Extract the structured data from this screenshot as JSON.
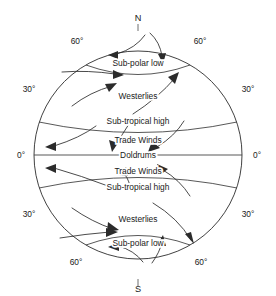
{
  "diagram": {
    "title_present": false,
    "type": "global-atmospheric-circulation",
    "poles": {
      "north": "N",
      "south": "S"
    },
    "latitude_labels": {
      "north_60_left": "60°",
      "north_60_right": "60°",
      "north_30_left": "30°",
      "north_30_right": "30°",
      "equator_left": "0°",
      "equator_right": "0°",
      "south_30_left": "30°",
      "south_30_right": "30°",
      "south_60_left": "60°",
      "south_60_right": "60°"
    },
    "zones": {
      "north_subpolar_low": "Sub-polar low",
      "north_westerlies": "Westerlies",
      "north_subtropical_high": "Sub-tropical high",
      "north_trade_winds": "Trade Winds",
      "doldrums": "Doldrums",
      "south_trade_winds": "Trade Winds",
      "south_subtropical_high": "Sub-tropical high",
      "south_westerlies": "Westerlies",
      "south_subpolar_low": "Sub-polar low"
    },
    "colors": {
      "background": "#ffffff",
      "outline": "#2b2b2b",
      "text": "#1a1a1a",
      "flow": "#2b2b2b"
    },
    "geometry": {
      "center_x": 138,
      "center_y": 155,
      "radius": 104
    }
  }
}
